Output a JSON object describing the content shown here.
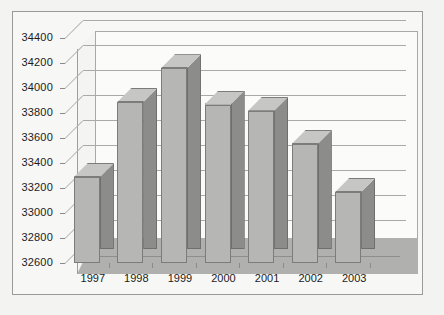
{
  "chart_data": {
    "type": "bar",
    "title": "",
    "subtitle": "",
    "xlabel": "",
    "ylabel": "",
    "categories": [
      "1997",
      "1998",
      "1999",
      "2000",
      "2001",
      "2002",
      "2003"
    ],
    "values": [
      33400,
      34000,
      34270,
      33980,
      33930,
      33665,
      33280
    ],
    "series": [
      {
        "name": "",
        "values": [
          33400,
          34000,
          34270,
          33980,
          33930,
          33665,
          33280
        ]
      }
    ],
    "ylim": [
      32600,
      34400
    ],
    "ytick_labels": [
      "34400",
      "34200",
      "34000",
      "33800",
      "33600",
      "33400",
      "33200",
      "33000",
      "32800",
      "32600"
    ],
    "ytick_values": [
      34400,
      34200,
      34000,
      33800,
      33600,
      33400,
      33200,
      33000,
      32800,
      32600
    ],
    "grid": true,
    "legend": false,
    "legend_position": "none",
    "style": "3d-column",
    "colors": {
      "bar_face": "#b6b6b4",
      "bar_side": "#8c8c8a",
      "bar_top": "#c6c6c4",
      "bar_outline": "#7c7c7a",
      "plot_background": "#fbfbfa",
      "floor": "#b0b0ae",
      "gridline": "#a9a9a9",
      "frame_border": "#9a9a9a",
      "page_background": "#f3f3f1",
      "text": "#1b1b1b"
    }
  }
}
